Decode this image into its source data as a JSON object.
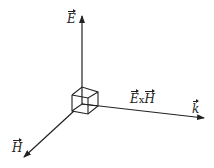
{
  "diagram": {
    "type": "vector-axes",
    "axes": [
      {
        "id": "E",
        "label": "E",
        "vector": true
      },
      {
        "id": "H",
        "label": "H",
        "vector": true
      },
      {
        "id": "k",
        "label": "k",
        "vector": true
      }
    ],
    "cross_product": {
      "left": "E",
      "op": "x",
      "right": "H"
    },
    "colors": {
      "line": "#222222",
      "background": "#ffffff"
    }
  }
}
